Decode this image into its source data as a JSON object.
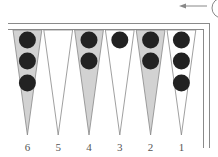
{
  "diagram": {
    "type": "backgammon-board-quadrant",
    "colors": {
      "frame": "#8a8a8a",
      "shaded_point": "#d2d2d2",
      "white_point": "#ffffff",
      "point_outline": "#888888",
      "checker": "#222222",
      "label": "#555555"
    },
    "direction_arrow": {
      "direction": "left"
    },
    "points": [
      {
        "number": "6",
        "shaded": true,
        "checkers": 3
      },
      {
        "number": "5",
        "shaded": false,
        "checkers": 0
      },
      {
        "number": "4",
        "shaded": true,
        "checkers": 2
      },
      {
        "number": "3",
        "shaded": false,
        "checkers": 1
      },
      {
        "number": "2",
        "shaded": true,
        "checkers": 2
      },
      {
        "number": "1",
        "shaded": false,
        "checkers": 3
      }
    ]
  }
}
